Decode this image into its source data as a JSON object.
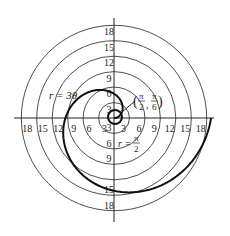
{
  "diagram": {
    "type": "polar-graph",
    "center": [
      114,
      118
    ],
    "scale_px_per_unit": 5.15,
    "ring_radii": [
      3,
      6,
      9,
      12,
      15,
      18
    ],
    "axis_tick_labels": {
      "top": [
        "3",
        "6",
        "9",
        "12",
        "15",
        "18"
      ],
      "bottom": [
        "3",
        "6",
        "9",
        "15",
        "18"
      ],
      "left": [
        "3",
        "6",
        "9",
        "12",
        "15",
        "18"
      ],
      "right": [
        "3",
        "6",
        "9",
        "12",
        "15",
        "18"
      ]
    },
    "curve": {
      "equation": "r = 3θ",
      "theta_range": [
        0,
        6.2832
      ],
      "color": "#111111"
    },
    "labels": {
      "curve_label": "r = 3θ",
      "point_label_num1": "π",
      "point_label_den1": "2",
      "point_label_num2": "π",
      "point_label_den2": "6",
      "point_label_open": "(",
      "point_label_close": ")",
      "point_label_comma": ",",
      "r_eq_label": "r =",
      "r_eq_num": "π",
      "r_eq_den": "2"
    },
    "colors": {
      "grid": "#222222",
      "curve": "#111111",
      "background": "#ffffff"
    }
  }
}
